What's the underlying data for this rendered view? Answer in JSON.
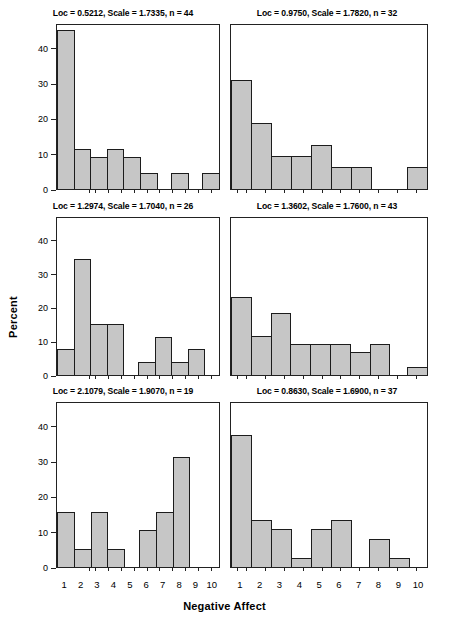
{
  "axis": {
    "ylabel": "Percent",
    "xlabel": "Negative Affect",
    "yticks": [
      "0",
      "10",
      "20",
      "30",
      "40"
    ],
    "xticks": [
      "1",
      "2",
      "3",
      "4",
      "5",
      "6",
      "7",
      "8",
      "9",
      "10"
    ]
  },
  "colors": {
    "bar_fill": "#c6c6c6",
    "bar_border": "#1c1c1c",
    "axis": "#222222",
    "background": "#ffffff"
  },
  "panels": [
    {
      "title": "Loc = 0.5212,  Scale = 1.7335, n = 44",
      "loc": "0.5212",
      "scale": "1.7335",
      "n": "44"
    },
    {
      "title": "Loc = 0.9750,  Scale = 1.7820, n = 32",
      "loc": "0.9750",
      "scale": "1.7820",
      "n": "32"
    },
    {
      "title": "Loc = 1.2974,  Scale = 1.7040, n = 26",
      "loc": "1.2974",
      "scale": "1.7040",
      "n": "26"
    },
    {
      "title": "Loc = 1.3602,  Scale = 1.7600, n = 43",
      "loc": "1.3602",
      "scale": "1.7600",
      "n": "43"
    },
    {
      "title": "Loc = 2.1079,  Scale = 1.9070, n = 19",
      "loc": "2.1079",
      "scale": "1.9070",
      "n": "19"
    },
    {
      "title": "Loc = 0.8630,  Scale = 1.6900, n = 37",
      "loc": "0.8630",
      "scale": "1.6900",
      "n": "37"
    }
  ],
  "chart_data": {
    "type": "bar",
    "title": "",
    "subtitle": "",
    "xlabel": "Negative Affect",
    "ylabel": "Percent",
    "categories": [
      "1",
      "2",
      "3",
      "4",
      "5",
      "6",
      "7",
      "8",
      "9",
      "10"
    ],
    "ylim": [
      0,
      47
    ],
    "yticks": [
      0,
      10,
      20,
      30,
      40
    ],
    "grid": false,
    "legend": "none",
    "layout": "3 rows x 2 columns of histogram panels, shared axes",
    "panels": [
      {
        "position": "top-left",
        "title": "Loc = 0.5212,  Scale = 1.7335, n = 44",
        "loc": 0.5212,
        "scale": 1.7335,
        "n": 44,
        "values": [
          45.5,
          11.4,
          9.1,
          11.4,
          9.1,
          4.5,
          0,
          4.5,
          0,
          4.5
        ]
      },
      {
        "position": "top-right",
        "title": "Loc = 0.9750,  Scale = 1.7820, n = 32",
        "loc": 0.975,
        "scale": 1.782,
        "n": 32,
        "values": [
          31.3,
          18.8,
          9.4,
          9.4,
          12.5,
          6.3,
          6.3,
          0,
          0,
          6.3
        ]
      },
      {
        "position": "middle-left",
        "title": "Loc = 1.2974,  Scale = 1.7040, n = 26",
        "loc": 1.2974,
        "scale": 1.704,
        "n": 26,
        "values": [
          7.7,
          34.6,
          15.4,
          15.4,
          0,
          3.8,
          11.5,
          3.8,
          7.7,
          0
        ]
      },
      {
        "position": "middle-right",
        "title": "Loc = 1.3602,  Scale = 1.7600, n = 43",
        "loc": 1.3602,
        "scale": 1.76,
        "n": 43,
        "values": [
          23.3,
          11.6,
          18.6,
          9.3,
          9.3,
          9.3,
          7.0,
          9.3,
          0,
          2.3
        ]
      },
      {
        "position": "bottom-left",
        "title": "Loc = 2.1079,  Scale = 1.9070, n = 19",
        "loc": 2.1079,
        "scale": 1.907,
        "n": 19,
        "values": [
          15.8,
          5.3,
          15.8,
          5.3,
          0,
          10.5,
          15.8,
          31.6,
          0,
          0
        ]
      },
      {
        "position": "bottom-right",
        "title": "Loc = 0.8630,  Scale = 1.6900, n = 37",
        "loc": 0.863,
        "scale": 1.69,
        "n": 37,
        "values": [
          37.8,
          13.5,
          10.8,
          2.7,
          10.8,
          13.5,
          0,
          8.1,
          2.7,
          0
        ]
      }
    ]
  }
}
